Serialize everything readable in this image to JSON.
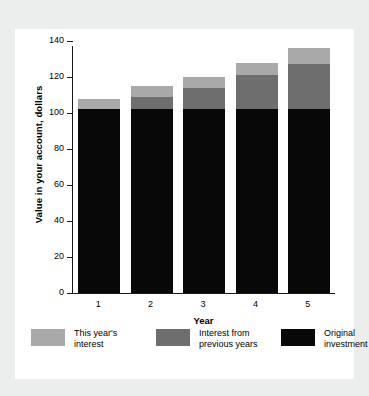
{
  "chart_data": {
    "type": "bar",
    "subtype": "stacked-bar",
    "title": "",
    "xlabel": "Year",
    "ylabel": "Value in your account, dollars",
    "categories": [
      "1",
      "2",
      "3",
      "4",
      "5"
    ],
    "x_tick_labels": [
      "1",
      "2",
      "3",
      "4",
      "5"
    ],
    "y_tick_labels": [
      "0",
      "20",
      "40",
      "60",
      "80",
      "100",
      "120",
      "140"
    ],
    "y_ticks": [
      0,
      20,
      40,
      60,
      80,
      100,
      120,
      140
    ],
    "ylim": [
      0,
      140
    ],
    "grid": false,
    "legend_position": "bottom",
    "series": [
      {
        "name": "Original investment",
        "color": "#080808",
        "values": [
          102,
          102,
          102,
          102,
          102
        ]
      },
      {
        "name": "Interest from previous years",
        "color": "#6e6e6e",
        "values": [
          0,
          7,
          12,
          19,
          25
        ]
      },
      {
        "name": "This year's interest",
        "color": "#a9a9a9",
        "values": [
          6,
          6,
          6,
          7,
          9
        ]
      }
    ],
    "totals": [
      108,
      115,
      120,
      128,
      136
    ]
  },
  "axes": {
    "y_title": "Value in your account, dollars",
    "x_title": "Year"
  },
  "legend": {
    "items": [
      {
        "label": "This year's\ninterest",
        "color": "#a9a9a9",
        "swatch": "light-gray-swatch"
      },
      {
        "label": "Interest from\nprevious years",
        "color": "#6e6e6e",
        "swatch": "mid-gray-swatch"
      },
      {
        "label": "Original\ninvestment",
        "color": "#080808",
        "swatch": "black-swatch"
      }
    ]
  },
  "colors": {
    "page_background": "#eceded",
    "card_background": "#ffffff",
    "axis": "#1a1a1a",
    "series_light": "#a9a9a9",
    "series_mid": "#6e6e6e",
    "series_dark": "#080808"
  }
}
